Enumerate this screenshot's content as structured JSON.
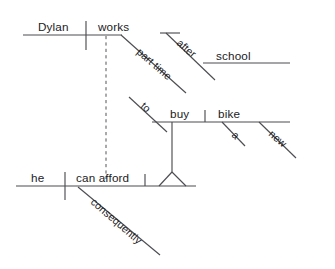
{
  "diagram": {
    "kind": "reed-kellogg-sentence-diagram",
    "background_color": "#ffffff",
    "line_color": "#4d4d52",
    "text_color": "#1b1b1e",
    "sentence": "Consequently he can afford a new bike to buy, Dylan works part time after school",
    "clauses": {
      "main": {
        "subject": "Dylan",
        "verb": "works",
        "modifiers": [
          "part time"
        ],
        "prepositional_phrase": {
          "preposition": "after",
          "object": "school"
        }
      },
      "infinitive": {
        "marker": "to",
        "verb": "buy",
        "object": "bike",
        "object_modifiers": [
          "a",
          "new"
        ]
      },
      "subordinate": {
        "subject": "he",
        "verb": "can afford",
        "conjunction": "consequently"
      }
    }
  },
  "labels": {
    "dylan": "Dylan",
    "works": "works",
    "part_time": "part time",
    "after": "after",
    "school": "school",
    "to": "to",
    "buy": "buy",
    "bike": "bike",
    "a": "a",
    "new": "new",
    "he": "he",
    "can_afford": "can afford",
    "consequently": "consequently"
  }
}
